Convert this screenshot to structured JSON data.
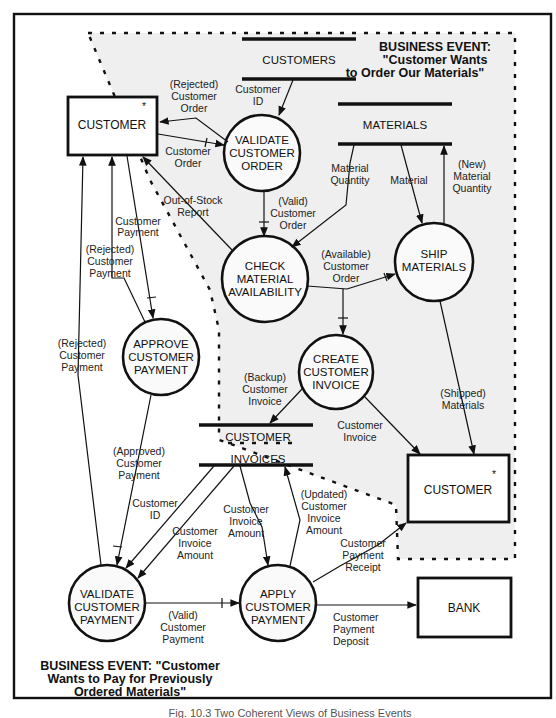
{
  "diagram": {
    "type": "data-flow-diagram",
    "colors": {
      "ink": "#111111",
      "event_region_fill": "#efefef",
      "background": "#ffffff"
    },
    "business_events": [
      {
        "id": "order",
        "lines": [
          "BUSINESS EVENT:",
          "\"Customer Wants",
          "to Order Our Materials\""
        ]
      },
      {
        "id": "pay",
        "lines": [
          "BUSINESS EVENT: \"Customer",
          "Wants to Pay for Previously",
          "Ordered Materials\""
        ]
      }
    ],
    "external_entities": [
      {
        "id": "customer_top",
        "label": "CUSTOMER",
        "marker": "*"
      },
      {
        "id": "customer_right",
        "label": "CUSTOMER",
        "marker": "*"
      },
      {
        "id": "bank",
        "label": "BANK"
      }
    ],
    "data_stores": [
      {
        "id": "customers",
        "label": "CUSTOMERS"
      },
      {
        "id": "materials",
        "label": "MATERIALS"
      },
      {
        "id": "customer_invoices",
        "label_lines": [
          "CUSTOMER",
          "INVOICES"
        ]
      }
    ],
    "processes": [
      {
        "id": "validate_order",
        "lines": [
          "VALIDATE",
          "CUSTOMER",
          "ORDER"
        ]
      },
      {
        "id": "check_availability",
        "lines": [
          "CHECK",
          "MATERIAL",
          "AVAILABILITY"
        ]
      },
      {
        "id": "ship",
        "lines": [
          "SHIP",
          "MATERIALS"
        ]
      },
      {
        "id": "create_invoice",
        "lines": [
          "CREATE",
          "CUSTOMER",
          "INVOICE"
        ]
      },
      {
        "id": "approve_payment",
        "lines": [
          "APPROVE",
          "CUSTOMER",
          "PAYMENT"
        ]
      },
      {
        "id": "validate_payment",
        "lines": [
          "VALIDATE",
          "CUSTOMER",
          "PAYMENT"
        ]
      },
      {
        "id": "apply_payment",
        "lines": [
          "APPLY",
          "CUSTOMER",
          "PAYMENT"
        ]
      }
    ],
    "flows": [
      {
        "id": "rejected_order",
        "lines": [
          "(Rejected)",
          "Customer",
          "Order"
        ]
      },
      {
        "id": "customer_id_top",
        "lines": [
          "Customer",
          "ID"
        ]
      },
      {
        "id": "customer_order",
        "lines": [
          "Customer",
          "Order"
        ]
      },
      {
        "id": "material_quantity",
        "lines": [
          "Material",
          "Quantity"
        ]
      },
      {
        "id": "material",
        "lines": [
          "Material"
        ]
      },
      {
        "id": "new_material_quantity",
        "lines": [
          "(New)",
          "Material",
          "Quantity"
        ]
      },
      {
        "id": "out_of_stock",
        "lines": [
          "Out-of-Stock",
          "Report"
        ]
      },
      {
        "id": "valid_order",
        "lines": [
          "(Valid)",
          "Customer",
          "Order"
        ]
      },
      {
        "id": "customer_payment",
        "lines": [
          "Customer",
          "Payment"
        ]
      },
      {
        "id": "rejected_payment_1",
        "lines": [
          "(Rejected)",
          "Customer",
          "Payment"
        ]
      },
      {
        "id": "available_order",
        "lines": [
          "(Available)",
          "Customer",
          "Order"
        ]
      },
      {
        "id": "rejected_payment_2",
        "lines": [
          "(Rejected)",
          "Customer",
          "Payment"
        ]
      },
      {
        "id": "backup_invoice",
        "lines": [
          "(Backup)",
          "Customer",
          "Invoice"
        ]
      },
      {
        "id": "shipped_materials",
        "lines": [
          "(Shipped)",
          "Materials"
        ]
      },
      {
        "id": "customer_invoice",
        "lines": [
          "Customer",
          "Invoice"
        ]
      },
      {
        "id": "approved_payment",
        "lines": [
          "(Approved)",
          "Customer",
          "Payment"
        ]
      },
      {
        "id": "customer_id_bottom",
        "lines": [
          "Customer",
          "ID"
        ]
      },
      {
        "id": "cust_invoice_amount_1",
        "lines": [
          "Customer",
          "Invoice",
          "Amount"
        ]
      },
      {
        "id": "cust_invoice_amount_2",
        "lines": [
          "Customer",
          "Invoice",
          "Amount"
        ]
      },
      {
        "id": "updated_invoice_amount",
        "lines": [
          "(Updated)",
          "Customer",
          "Invoice",
          "Amount"
        ]
      },
      {
        "id": "payment_receipt",
        "lines": [
          "Customer",
          "Payment",
          "Receipt"
        ]
      },
      {
        "id": "valid_payment",
        "lines": [
          "(Valid)",
          "Customer",
          "Payment"
        ]
      },
      {
        "id": "payment_deposit",
        "lines": [
          "Customer",
          "Payment",
          "Deposit"
        ]
      }
    ],
    "caption": "Fig. 10.3  Two Coherent Views of Business Events"
  }
}
